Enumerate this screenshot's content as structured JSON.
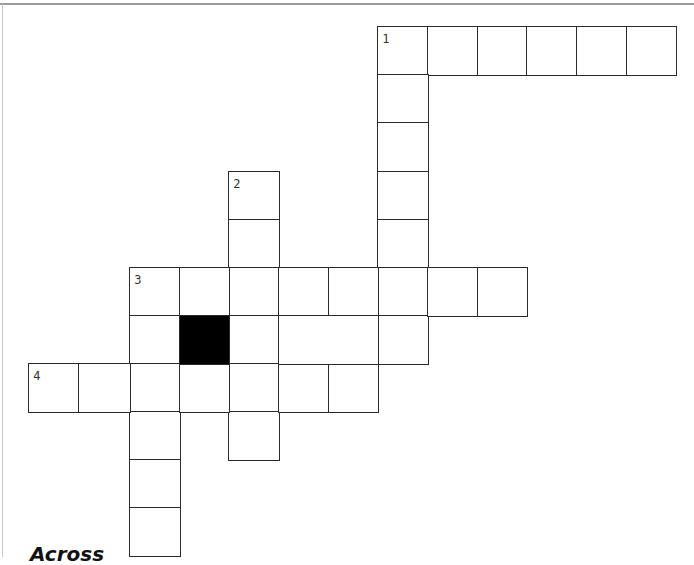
{
  "puzzle": {
    "type": "crossword",
    "cell_size": 49.7,
    "origin": {
      "x": 29,
      "y": 27
    },
    "col_edges": [
      29,
      79,
      130,
      180,
      229,
      279,
      329,
      378,
      428,
      478,
      527,
      577,
      627,
      676
    ],
    "row_edges": [
      27,
      75,
      123,
      172,
      220,
      268,
      316,
      364,
      412,
      460,
      508,
      556
    ],
    "clue_numbers": [
      {
        "number": "1",
        "row": 0,
        "col": 7
      },
      {
        "number": "2",
        "row": 3,
        "col": 4
      },
      {
        "number": "3",
        "row": 5,
        "col": 2
      },
      {
        "number": "4",
        "row": 7,
        "col": 0
      }
    ],
    "entries": [
      {
        "number": "1",
        "direction": "across",
        "row": 0,
        "col": 7,
        "length": 6
      },
      {
        "number": "1",
        "direction": "down",
        "row": 0,
        "col": 7,
        "length": 7
      },
      {
        "number": "2",
        "direction": "down",
        "row": 3,
        "col": 4,
        "length": 6
      },
      {
        "number": "3",
        "direction": "across",
        "row": 5,
        "col": 2,
        "length": 8
      },
      {
        "number": "3",
        "direction": "down",
        "row": 5,
        "col": 2,
        "length": 6
      },
      {
        "number": "4",
        "direction": "across",
        "row": 7,
        "col": 0,
        "length": 7
      }
    ],
    "extra_cells": [
      {
        "row": 6,
        "col": 3,
        "block": true
      },
      {
        "row": 6,
        "col": 5,
        "span": 2
      }
    ]
  },
  "clues": {
    "across_heading": "Across"
  },
  "colors": {
    "grid_line": "#2b2b2b",
    "block": "#000000",
    "background": "#ffffff"
  }
}
